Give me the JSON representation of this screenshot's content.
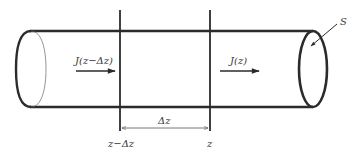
{
  "diagram": {
    "type": "cylindrical-tube-flux-element",
    "colors": {
      "stroke": "#2b2b2b",
      "thin_stroke": "#555555",
      "background": "#ffffff"
    },
    "labels": {
      "flux_in": "J(z−Δz)",
      "flux_out": "J(z)",
      "cross_section": "S",
      "position_left": "z−Δz",
      "position_right": "z",
      "element_length": "Δz"
    }
  }
}
